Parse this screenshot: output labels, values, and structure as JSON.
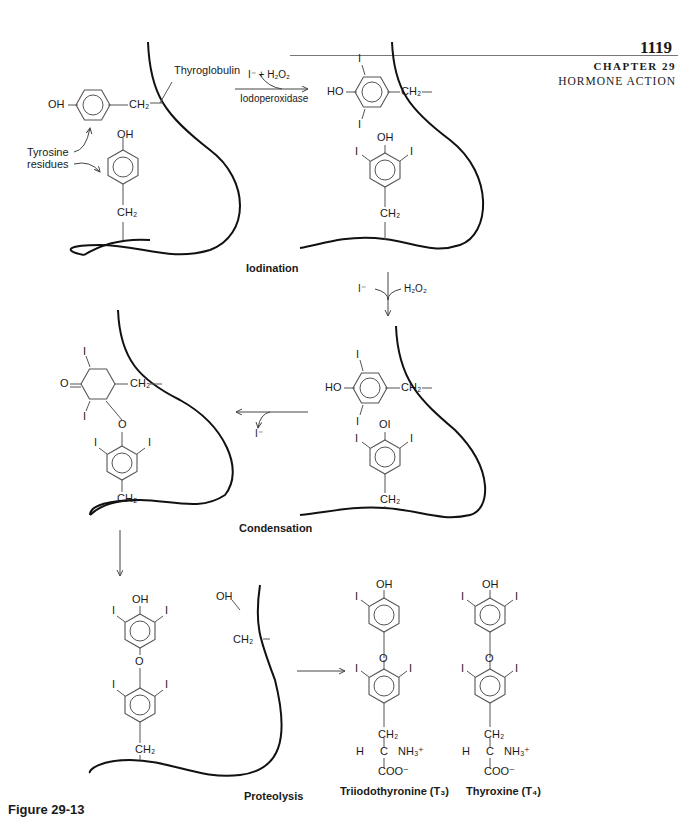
{
  "header": {
    "page_number": "1119",
    "chapter": "CHAPTER 29",
    "subject": "HORMONE ACTION"
  },
  "figure": {
    "caption": "Figure 29-13",
    "steps": {
      "iodination": "Iodination",
      "condensation": "Condensation",
      "proteolysis": "Proteolysis"
    },
    "labels": {
      "thyroglobulin": "Thyroglobulin",
      "tyrosine_residues_line1": "Tyrosine",
      "tyrosine_residues_line2": "residues",
      "enzyme": "Iodoperoxidase",
      "reagents_step1": "I⁻ + H₂O₂",
      "reagent_iodide": "I⁻",
      "reagent_peroxide": "H₂O₂",
      "released_iodide": "I⁻"
    },
    "products": {
      "t3": "Triiodothyronine (T₃)",
      "t4": "Thyroxine (T₄)"
    },
    "groups": {
      "oh": "OH",
      "ho": "HO",
      "ch2": "CH₂",
      "iodine": "I",
      "oxygen": "O",
      "oi": "OI",
      "h": "H",
      "c": "C",
      "nh3": "NH₃⁺",
      "coo": "COO⁻"
    }
  }
}
